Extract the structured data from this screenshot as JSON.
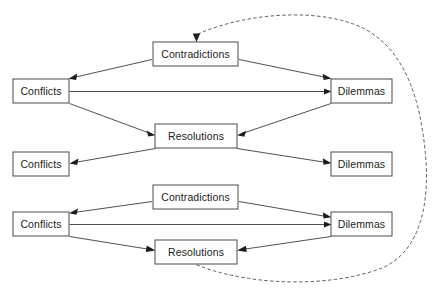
{
  "diagram": {
    "background_color": "#ffffff",
    "node_stroke_color": "#4a4a4a",
    "edge_color": "#3c3c3c",
    "dashed_edge_color": "#5a5a5a",
    "labels": {
      "conflicts": "Conflicts",
      "contradictions": "Contradictions",
      "dilemmas": "Dilemmas",
      "resolutions": "Resolutions"
    },
    "nodes": [
      {
        "id": "contradictions-1",
        "label": "Contradictions",
        "x": 153,
        "y": 42,
        "w": 85,
        "h": 24
      },
      {
        "id": "conflicts-1",
        "label": "Conflicts",
        "x": 13,
        "y": 79,
        "w": 56,
        "h": 24
      },
      {
        "id": "dilemmas-1",
        "label": "Dilemmas",
        "x": 331,
        "y": 79,
        "w": 61,
        "h": 24
      },
      {
        "id": "resolutions-1",
        "label": "Resolutions",
        "x": 155,
        "y": 124,
        "w": 82,
        "h": 24
      },
      {
        "id": "conflicts-2",
        "label": "Conflicts",
        "x": 13,
        "y": 152,
        "w": 56,
        "h": 24
      },
      {
        "id": "dilemmas-2",
        "label": "Dilemmas",
        "x": 331,
        "y": 152,
        "w": 61,
        "h": 24
      },
      {
        "id": "contradictions-2",
        "label": "Contradictions",
        "x": 153,
        "y": 185,
        "w": 85,
        "h": 24
      },
      {
        "id": "conflicts-3",
        "label": "Conflicts",
        "x": 13,
        "y": 212,
        "w": 56,
        "h": 24
      },
      {
        "id": "dilemmas-3",
        "label": "Dilemmas",
        "x": 331,
        "y": 212,
        "w": 61,
        "h": 24
      },
      {
        "id": "resolutions-2",
        "label": "Resolutions",
        "x": 155,
        "y": 240,
        "w": 82,
        "h": 24
      }
    ],
    "edges": [
      {
        "from": "contradictions-1",
        "to": "conflicts-1",
        "style": "solid",
        "arrow": "end"
      },
      {
        "from": "contradictions-1",
        "to": "dilemmas-1",
        "style": "solid",
        "arrow": "end"
      },
      {
        "from": "conflicts-1",
        "to": "dilemmas-1",
        "style": "solid",
        "arrow": "end"
      },
      {
        "from": "conflicts-1",
        "to": "resolutions-1",
        "style": "solid",
        "arrow": "end"
      },
      {
        "from": "dilemmas-1",
        "to": "resolutions-1",
        "style": "solid",
        "arrow": "end"
      },
      {
        "from": "resolutions-1",
        "to": "conflicts-2",
        "style": "solid",
        "arrow": "end"
      },
      {
        "from": "resolutions-1",
        "to": "dilemmas-2",
        "style": "solid",
        "arrow": "end"
      },
      {
        "from": "contradictions-2",
        "to": "conflicts-3",
        "style": "solid",
        "arrow": "end"
      },
      {
        "from": "contradictions-2",
        "to": "dilemmas-3",
        "style": "solid",
        "arrow": "end"
      },
      {
        "from": "conflicts-3",
        "to": "dilemmas-3",
        "style": "solid",
        "arrow": "end"
      },
      {
        "from": "conflicts-3",
        "to": "resolutions-2",
        "style": "solid",
        "arrow": "end"
      },
      {
        "from": "dilemmas-3",
        "to": "resolutions-2",
        "style": "solid",
        "arrow": "end"
      },
      {
        "from": "resolutions-2",
        "to": "contradictions-1",
        "style": "dashed",
        "arrow": "end",
        "note": "feedback loop curving around the right side"
      }
    ]
  }
}
